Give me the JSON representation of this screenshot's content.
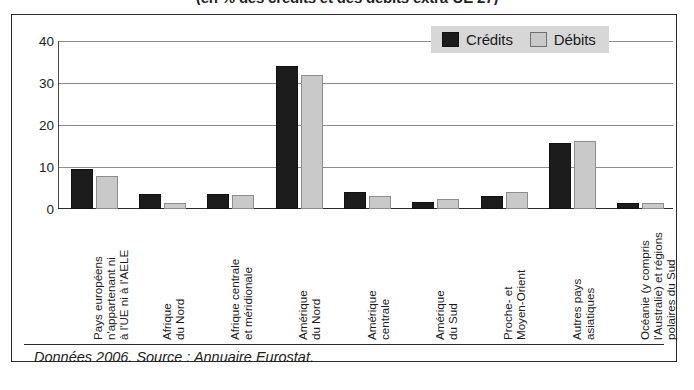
{
  "figure": {
    "title": "(en % des crédits et des débits extra-UE 27)",
    "source_caption": "Données 2006. Source : Annuaire Eurostat."
  },
  "legend": {
    "position": "top-right",
    "entries": [
      {
        "label": "Crédits",
        "color": "#1c1c1c",
        "swatch": "credits-swatch"
      },
      {
        "label": "Débits",
        "color": "#c9c9c9",
        "swatch": "debits-swatch"
      }
    ]
  },
  "axis": {
    "y_ticks": [
      "0",
      "10",
      "20",
      "30",
      "40"
    ]
  },
  "chart_data": {
    "type": "bar",
    "title": "(en % des crédits et des débits extra-UE 27)",
    "xlabel": "",
    "ylabel": "",
    "ylim": [
      0,
      40
    ],
    "yticks": [
      0,
      10,
      20,
      30,
      40
    ],
    "grid": true,
    "legend_position": "top-right",
    "annotations": [
      "Données 2006. Source : Annuaire Eurostat."
    ],
    "categories": [
      "Pays européens n'appartenant ni à l'UE ni à l'AELE",
      "Afrique du Nord",
      "Afrique centrale et méridionale",
      "Amérique du Nord",
      "Amérique centrale",
      "Amérique du Sud",
      "Proche- et Moyen-Orient",
      "Autres pays asiatiques",
      "Océanie (y compris l'Australie) et régions polaires du Sud"
    ],
    "category_lines": [
      [
        "Pays européens",
        "n'appartenant ni",
        "à l'UE ni à l'AELE"
      ],
      [
        "Afrique",
        "du Nord"
      ],
      [
        "Afrique centrale",
        "et méridionale"
      ],
      [
        "Amérique",
        "du Nord"
      ],
      [
        "Amérique",
        "centrale"
      ],
      [
        "Amérique",
        "du Sud"
      ],
      [
        "Proche- et",
        "Moyen-Orient"
      ],
      [
        "Autres pays",
        "asiatiques"
      ],
      [
        "Océanie (y compris",
        "l'Australie) et régions",
        "polaires du Sud"
      ]
    ],
    "series": [
      {
        "name": "Crédits",
        "color": "#1c1c1c",
        "values": [
          9.5,
          3.6,
          3.5,
          34,
          4.1,
          1.7,
          3.0,
          15.8,
          1.4
        ]
      },
      {
        "name": "Débits",
        "color": "#c9c9c9",
        "values": [
          7.8,
          1.4,
          3.4,
          31.8,
          3.0,
          2.3,
          4.0,
          16.1,
          1.5
        ]
      }
    ]
  }
}
